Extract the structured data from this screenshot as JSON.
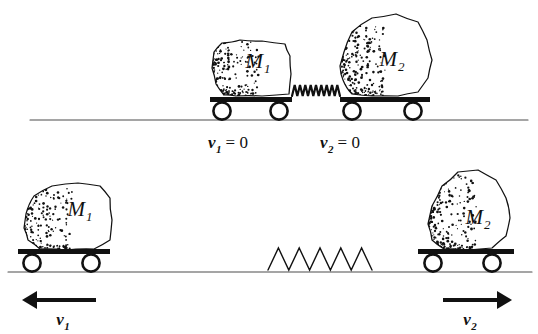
{
  "figure": {
    "type": "physics-diagram",
    "background_color": "#ffffff",
    "ink_color": "#111111"
  },
  "panels": [
    {
      "id": "before",
      "description": "Two carts at rest touching a compressed spring",
      "ground_line": {
        "x1": 30,
        "x2": 528,
        "y": 120
      },
      "carts": [
        {
          "name": "cart-m1",
          "mass_label": "M",
          "mass_subscript": "1",
          "platform": {
            "x": 210,
            "y": 97,
            "width": 82,
            "height": 5
          },
          "wheels": [
            {
              "cx": 222,
              "cy": 111
            },
            {
              "cx": 279,
              "cy": 111
            }
          ]
        },
        {
          "name": "cart-m2",
          "mass_label": "M",
          "mass_subscript": "2",
          "platform": {
            "x": 340,
            "y": 97,
            "width": 90,
            "height": 5
          },
          "wheels": [
            {
              "cx": 352,
              "cy": 111
            },
            {
              "cx": 413,
              "cy": 111
            }
          ]
        }
      ],
      "spring": {
        "name": "compressed-spring",
        "state": "compressed",
        "x1": 292,
        "x2": 340,
        "y": 96,
        "coils": 9,
        "amplitude": 11,
        "stroke": 2.2
      },
      "velocity_labels": [
        {
          "name": "velocity-v1-zero",
          "symbol": "v",
          "subscript": "1",
          "equals": "= 0",
          "x": 228,
          "y": 148
        },
        {
          "name": "velocity-v2-zero",
          "symbol": "v",
          "subscript": "2",
          "equals": "= 0",
          "x": 340,
          "y": 148
        }
      ]
    },
    {
      "id": "after",
      "description": "Carts moving apart, spring relaxed on the ground",
      "ground_line": {
        "x1": 8,
        "x2": 532,
        "y": 272
      },
      "carts": [
        {
          "name": "cart-m1",
          "mass_label": "M",
          "mass_subscript": "1",
          "platform": {
            "x": 18,
            "y": 249,
            "width": 92,
            "height": 5
          },
          "wheels": [
            {
              "cx": 32,
              "cy": 263
            },
            {
              "cx": 91,
              "cy": 263
            }
          ]
        },
        {
          "name": "cart-m2",
          "mass_label": "M",
          "mass_subscript": "2",
          "platform": {
            "x": 418,
            "y": 249,
            "width": 96,
            "height": 5
          },
          "wheels": [
            {
              "cx": 433,
              "cy": 263
            },
            {
              "cx": 492,
              "cy": 263
            }
          ]
        }
      ],
      "spring": {
        "name": "relaxed-spring",
        "state": "relaxed",
        "x1": 268,
        "x2": 372,
        "y": 270,
        "coils": 5,
        "amplitude": 22,
        "stroke": 1.4
      },
      "velocity_arrows": [
        {
          "name": "velocity-arrow-v1",
          "direction": "left",
          "symbol": "v",
          "subscript": "1",
          "arrow": {
            "x1": 96,
            "x2": 22,
            "y": 300
          },
          "label_x": 63,
          "label_y": 325
        },
        {
          "name": "velocity-arrow-v2",
          "direction": "right",
          "symbol": "v",
          "subscript": "2",
          "arrow": {
            "x1": 443,
            "x2": 512,
            "y": 300
          },
          "label_x": 470,
          "label_y": 325
        }
      ]
    }
  ]
}
